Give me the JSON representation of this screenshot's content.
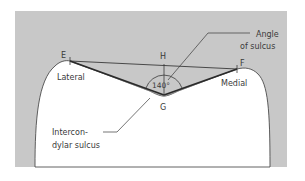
{
  "figure": {
    "colors": {
      "panel": "#c8c8c8",
      "bone": "#ffffff",
      "line": "#3a3a3a",
      "text": "#3a3a3a"
    },
    "points": {
      "E": "E",
      "F": "F",
      "G": "G",
      "H": "H"
    },
    "angle": "140°",
    "labels": {
      "lateral": "Lateral",
      "medial": "Medial",
      "angle_of_sulcus_line1": "Angle",
      "angle_of_sulcus_line2": "of sulcus",
      "intercondylar_line1": "Intercon-",
      "intercondylar_line2": "dylar sulcus"
    }
  }
}
